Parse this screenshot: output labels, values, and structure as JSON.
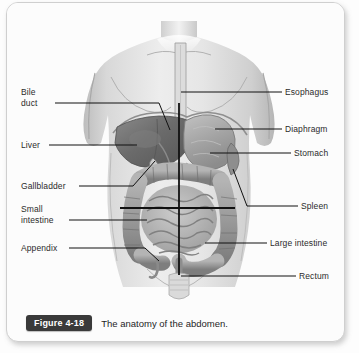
{
  "figure": {
    "badge": "Figure 4-18",
    "caption": "The anatomy of the abdomen."
  },
  "labels_left": [
    {
      "name": "bile-duct",
      "text": "Bile\nduct",
      "x": 14,
      "y": 88,
      "leader_y": 100,
      "leader_x1": 48,
      "leader_x2": 152,
      "tip_x": 152,
      "tip_y": 127
    },
    {
      "name": "liver",
      "text": "Liver",
      "x": 14,
      "y": 137,
      "leader_y": 142,
      "leader_x1": 42,
      "leader_x2": 126,
      "tip_x": 126,
      "tip_y": 142
    },
    {
      "name": "gallbladder",
      "text": "Gallbladder",
      "x": 14,
      "y": 178,
      "leader_y": 183,
      "leader_x1": 72,
      "leader_x2": 126,
      "tip_x": 147,
      "tip_y": 157
    },
    {
      "name": "small-intestine",
      "text": "Small\nintestine",
      "x": 14,
      "y": 200,
      "leader_y": 217,
      "leader_x1": 62,
      "leader_x2": 133,
      "tip_x": 133,
      "tip_y": 217
    },
    {
      "name": "appendix",
      "text": "Appendix",
      "x": 14,
      "y": 240,
      "leader_y": 245,
      "leader_x1": 62,
      "leader_x2": 150,
      "tip_x": 150,
      "tip_y": 245
    }
  ],
  "labels_right": [
    {
      "name": "esophagus",
      "text": "Esophagus",
      "x": 278,
      "y": 84,
      "leader_y": 89,
      "leader_x1": 176,
      "leader_x2": 275
    },
    {
      "name": "diaphragm",
      "text": "Diaphragm",
      "x": 278,
      "y": 121,
      "leader_y": 126,
      "leader_x1": 208,
      "leader_x2": 275
    },
    {
      "name": "stomach",
      "text": "Stomach",
      "x": 287,
      "y": 145,
      "leader_y": 150,
      "leader_x1": 203,
      "leader_x2": 284
    },
    {
      "name": "spleen",
      "text": "Spleen",
      "x": 294,
      "y": 198,
      "leader_y": 203,
      "leader_x1": 215,
      "leader_x2": 291
    },
    {
      "name": "large-intestine",
      "text": "Large intestine",
      "x": 263,
      "y": 235,
      "leader_y": 240,
      "leader_x1": 196,
      "leader_x2": 260
    },
    {
      "name": "rectum",
      "text": "Rectum",
      "x": 292,
      "y": 268,
      "leader_y": 273,
      "leader_x1": 176,
      "leader_x2": 289
    }
  ],
  "reference_lines": {
    "vertical_midline": {
      "x": 172,
      "y1": 100,
      "y2": 272
    },
    "horizontal_quadrant": {
      "y": 205,
      "x1": 113,
      "x2": 228
    }
  },
  "colors": {
    "skin_light": "#e9e9e9",
    "skin_mid": "#d2d2d2",
    "skin_shadow": "#b4b4b4",
    "liver": "#6e6e6e",
    "stomach": "#a6a6a6",
    "intestine_large": "#9a9a9a",
    "intestine_small": "#b8b8b8",
    "leader_line": "#1a1a1a",
    "badge_bg": "#3a3a3a",
    "card_border": "#cfcfcf"
  }
}
